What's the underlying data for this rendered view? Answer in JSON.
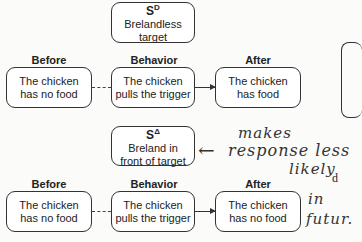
{
  "top_diagram": {
    "stimulus": {
      "symbol": "S",
      "superscript": "D",
      "text_line1": "Brelandless",
      "text_line2": "target"
    },
    "before": {
      "label": "Before",
      "line1": "The chicken",
      "line2": "has no food"
    },
    "behavior": {
      "label": "Behavior",
      "line1": "The chicken",
      "line2": "pulls the trigger"
    },
    "after": {
      "label": "After",
      "line1": "The chicken",
      "line2": "has food"
    }
  },
  "bottom_diagram": {
    "stimulus": {
      "symbol": "S",
      "superscript": "Δ",
      "text_line1": "Breland in",
      "text_line2": "front of target"
    },
    "before": {
      "label": "Before",
      "line1": "The chicken",
      "line2": "has no food"
    },
    "behavior": {
      "label": "Behavior",
      "line1": "The chicken",
      "line2": "pulls the trigger"
    },
    "after": {
      "label": "After",
      "line1": "The chicken",
      "line2": "has no food"
    }
  },
  "handwriting": {
    "arrow": "←",
    "line1": "makes",
    "line2": "response less",
    "line3": "likely",
    "line4": "in",
    "line5": "futur."
  },
  "cutoff_text": "d"
}
